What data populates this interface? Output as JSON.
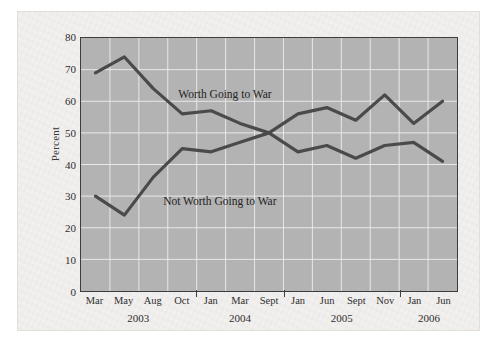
{
  "chart_data": {
    "type": "line",
    "title": "",
    "xlabel": "",
    "ylabel": "Percent",
    "ylim": [
      0,
      80
    ],
    "yticks": [
      0,
      10,
      20,
      30,
      40,
      50,
      60,
      70,
      80
    ],
    "grid": true,
    "legend_position": "inline-annotation",
    "categories": [
      "Mar",
      "May",
      "Aug",
      "Oct",
      "Jan",
      "Mar",
      "Sept",
      "Jan",
      "Jun",
      "Sept",
      "Nov",
      "Jan",
      "Jun"
    ],
    "year_groups": [
      {
        "label": "2003",
        "start_index": 0,
        "end_index": 3
      },
      {
        "label": "2004",
        "start_index": 4,
        "end_index": 6
      },
      {
        "label": "2005",
        "start_index": 7,
        "end_index": 10
      },
      {
        "label": "2006",
        "start_index": 11,
        "end_index": 12
      }
    ],
    "series": [
      {
        "name": "Worth Going to War",
        "color": "#4a4a4a",
        "values": [
          69,
          74,
          64,
          56,
          57,
          53,
          50,
          56,
          58,
          54,
          62,
          53,
          60
        ]
      },
      {
        "name": "Not Worth Going to War",
        "color": "#4a4a4a",
        "values": [
          30,
          24,
          36,
          45,
          44,
          47,
          50,
          44,
          46,
          42,
          46,
          47,
          41
        ]
      }
    ],
    "annotations": [
      {
        "text": "Worth Going to War",
        "x_pct": 26,
        "y_pct": 20
      },
      {
        "text": "Not Worth Going to War",
        "x_pct": 22,
        "y_pct": 62
      }
    ],
    "colors": {
      "plot_background": "#b3b3b3",
      "gridline": "#e8e8e8",
      "line": "#4a4a4a",
      "axis": "#3d3d3d",
      "page_background": "#f2f0ee"
    }
  }
}
